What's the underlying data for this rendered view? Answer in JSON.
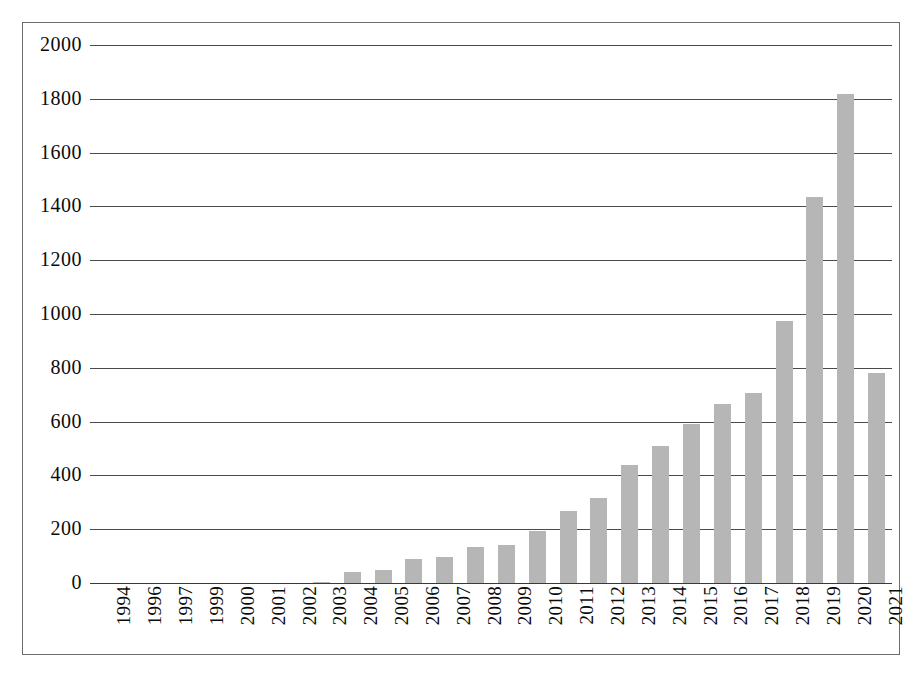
{
  "chart_data": {
    "type": "bar",
    "title": "",
    "subtitle": "",
    "xlabel": "",
    "ylabel": "",
    "categories": [
      "1994",
      "1996",
      "1997",
      "1999",
      "2000",
      "2001",
      "2002",
      "2003",
      "2004",
      "2005",
      "2006",
      "2007",
      "2008",
      "2009",
      "2010",
      "2011",
      "2012",
      "2013",
      "2014",
      "2015",
      "2016",
      "2017",
      "2018",
      "2019",
      "2020",
      "2021"
    ],
    "values": [
      0,
      0,
      0,
      0,
      0,
      0,
      0,
      3,
      40,
      50,
      88,
      97,
      133,
      140,
      192,
      268,
      315,
      440,
      508,
      590,
      665,
      705,
      975,
      1435,
      1818,
      780
    ],
    "ylim": [
      0,
      2000
    ],
    "y_ticks": [
      0,
      200,
      400,
      600,
      800,
      1000,
      1200,
      1400,
      1600,
      1800,
      2000
    ],
    "y_tick_labels": [
      "0",
      "200",
      "400",
      "600",
      "800",
      "1000",
      "1200",
      "1400",
      "1600",
      "1800",
      "2000"
    ],
    "grid": true,
    "grid_axis": "y",
    "legend": false,
    "legend_position": "none",
    "bar_color": "#b6b6b6",
    "gridline_color": "#4a4a4a",
    "axis_text_color": "#0b0b0b",
    "frame_border_color": "#6d6d6d",
    "background_color": "#ffffff"
  }
}
